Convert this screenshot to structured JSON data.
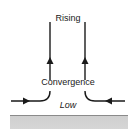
{
  "diagram": {
    "labels": {
      "rising": "Rising",
      "convergence": "Convergence",
      "low": "Low"
    },
    "colors": {
      "arrows": "#1a1a1a",
      "ground": "#d4d4d4",
      "ground_edge": "#8a8a8a"
    },
    "elements": {
      "vertical_arrows": 2,
      "horizontal_inflow_arrows": 2,
      "arrow_direction_vertical": "up",
      "arrow_direction_horizontal": "inward"
    }
  }
}
